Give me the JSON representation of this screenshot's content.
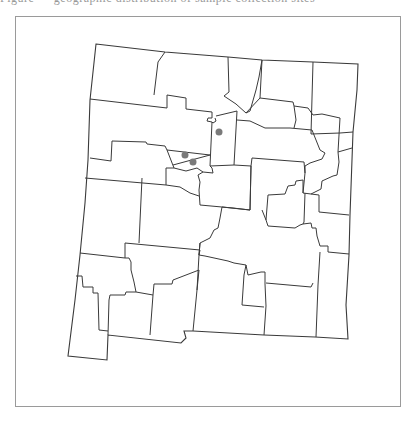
{
  "caption": {
    "text": "Figure — geographic distribution of sample collection sites",
    "visible": "cropped-top"
  },
  "map": {
    "region": "New Mexico",
    "features": "county boundaries",
    "line_color": "#3a3a3a",
    "frame_color": "#9a9a9a",
    "background": "#ffffff"
  },
  "points": [
    {
      "x": 219,
      "y": 132,
      "color": "#7a7a7a",
      "radius": 3.5
    },
    {
      "x": 185,
      "y": 155,
      "color": "#7a7a7a",
      "radius": 3.5
    },
    {
      "x": 193,
      "y": 162,
      "color": "#7a7a7a",
      "radius": 3.5
    }
  ]
}
